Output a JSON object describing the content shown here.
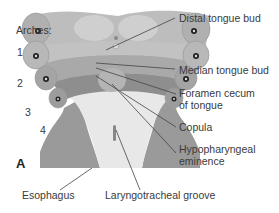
{
  "figure": {
    "panel_letter": "A",
    "arches_heading": "Arches:",
    "arch_numbers": [
      "1",
      "2",
      "3",
      "4"
    ],
    "labels": {
      "distal_tongue_bud": "Distal tongue bud",
      "median_tongue_bud": "Median tongue bud",
      "foramen_cecum_line1": "Foramen cecum",
      "foramen_cecum_line2": "of tongue",
      "copula": "Copula",
      "hypopharyngeal_line1": "Hypopharyngeal",
      "hypopharyngeal_line2": "eminence",
      "esophagus": "Esophagus",
      "laryngotracheal_groove": "Laryngotracheal groove"
    },
    "colors": {
      "arch1": "#b9b9b9",
      "arch2": "#c4c4c4",
      "arch3": "#a8a8a8",
      "arch4": "#8e8e8e",
      "pharynx_floor": "#e6e6e6",
      "leader_line": "#444444"
    }
  }
}
